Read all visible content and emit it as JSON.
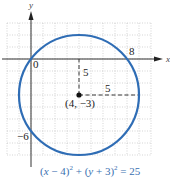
{
  "chart_data": {
    "type": "diagram",
    "title": "",
    "equation": {
      "text": "(x − 4)^2 + (y + 3)^2 = 25",
      "parts": [
        "(",
        "x",
        " − 4)",
        "2",
        " + (",
        "y",
        " + 3)",
        "2",
        " = 25"
      ]
    },
    "circle": {
      "center": [
        4,
        -3
      ],
      "radius": 5,
      "color": "#2f6db5"
    },
    "center_label": "(4, −3)",
    "axes": {
      "x_label": "x",
      "y_label": "y"
    },
    "grid": {
      "x_range": [
        -2,
        10
      ],
      "y_range": [
        -8,
        3
      ],
      "step": 1,
      "style": "dotted"
    },
    "tick_labels": [
      {
        "text": "0",
        "at": [
          0,
          0
        ]
      },
      {
        "text": "8",
        "at": [
          8,
          0
        ]
      },
      {
        "text": "−6",
        "at": [
          0,
          -6
        ]
      }
    ],
    "radius_segments": [
      {
        "from": [
          4,
          -3
        ],
        "to": [
          4,
          0
        ],
        "label": "5",
        "style": "dashed"
      },
      {
        "from": [
          4,
          -3
        ],
        "to": [
          9,
          -3
        ],
        "label": "5",
        "style": "dashed"
      }
    ]
  },
  "labels": {
    "y_axis": "y",
    "x_axis": "x",
    "origin": "0",
    "x_intercept": "8",
    "y_intercept": "−6",
    "radius_vertical": "5",
    "radius_horizontal": "5",
    "center": "(4, −3)"
  },
  "equation": {
    "open1": "(",
    "x": "x",
    "rest1": " − 4)",
    "exp1": "2",
    "plus": " + (",
    "y": "y",
    "rest2": " + 3)",
    "exp2": "2",
    "equals": " = 25"
  }
}
